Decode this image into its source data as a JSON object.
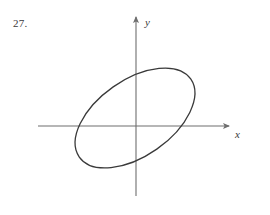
{
  "figure": {
    "problem_number": "27.",
    "background_color": "#ffffff",
    "stroke_color": "#3a3a3a",
    "axis_color": "#6e6e6e",
    "axes": {
      "origin": {
        "x": 136,
        "y": 126
      },
      "x_axis": {
        "label": "x",
        "label_position": {
          "x": 235,
          "y": 138
        },
        "start": {
          "x": 38,
          "y": 126
        },
        "end": {
          "x": 229,
          "y": 126
        },
        "arrow": "right"
      },
      "y_axis": {
        "label": "y",
        "label_position": {
          "x": 145,
          "y": 26
        },
        "start": {
          "x": 136,
          "y": 196
        },
        "end": {
          "x": 136,
          "y": 17
        },
        "arrow": "up"
      }
    },
    "curve": {
      "shape_name": "ellipse",
      "center": {
        "x": 135,
        "y": 118
      },
      "semi_major_axis": 68,
      "semi_minor_axis": 38,
      "rotation_degrees": -35,
      "stroke_width": 1.3,
      "fill": "none"
    }
  }
}
